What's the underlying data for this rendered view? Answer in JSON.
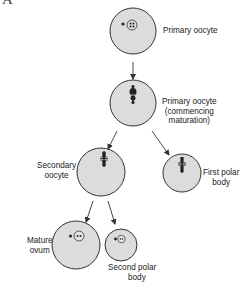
{
  "figure": {
    "panel_letter": "A",
    "colors": {
      "cell_fill": "#dcdcdc",
      "cell_stroke": "#333333",
      "chromosome": "#222222",
      "arrow": "#333333",
      "text": "#222222"
    }
  },
  "nodes": {
    "primary_oocyte": {
      "label_lines": [
        "Primary oocyte"
      ]
    },
    "commencing_maturation": {
      "label_lines": [
        "Primary oocyte",
        "(commencing",
        "maturation)"
      ]
    },
    "secondary_oocyte": {
      "label_lines": [
        "Secondary",
        "oocyte"
      ]
    },
    "first_polar_body": {
      "label_lines": [
        "First polar",
        "body"
      ]
    },
    "mature_ovum": {
      "label_lines": [
        "Mature",
        "ovum"
      ]
    },
    "second_polar_body": {
      "label_lines": [
        "Second polar",
        "body"
      ]
    }
  },
  "edges": [
    {
      "from": "primary_oocyte",
      "to": "commencing_maturation"
    },
    {
      "from": "commencing_maturation",
      "to": "secondary_oocyte"
    },
    {
      "from": "commencing_maturation",
      "to": "first_polar_body"
    },
    {
      "from": "secondary_oocyte",
      "to": "mature_ovum"
    },
    {
      "from": "secondary_oocyte",
      "to": "second_polar_body"
    }
  ]
}
